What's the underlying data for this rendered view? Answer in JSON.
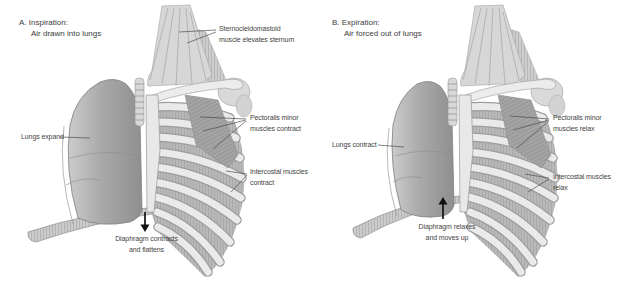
{
  "figure": {
    "panels": [
      {
        "id": "a",
        "title": "A. Inspiration:",
        "subtitle": "Air drawn into lungs",
        "labels": {
          "sternocleidomastoid": "Sternocleidomastoid\nmuscle elevates sternum",
          "lungs": "Lungs expand",
          "pectoralis": "Pectoralis minor\nmuscles contract",
          "intercostal": "Intercostal muscles\ncontract",
          "diaphragm": "Diaphragm contracts\nand flattens"
        },
        "diaphragm_arrow_direction": "down"
      },
      {
        "id": "b",
        "title": "B. Expiration:",
        "subtitle": "Air forced out of lungs",
        "labels": {
          "lungs": "Lungs contract",
          "pectoralis": "Pectoralis minor\nmuscles relax",
          "intercostal": "Intercostal muscles\nrelax",
          "diaphragm": "Diaphragm relaxes\nand moves up"
        },
        "diaphragm_arrow_direction": "up"
      }
    ],
    "colors": {
      "background": "#ffffff",
      "label_text": "#444444",
      "leader_line": "#4c4c4c",
      "arrow": "#111111"
    }
  }
}
